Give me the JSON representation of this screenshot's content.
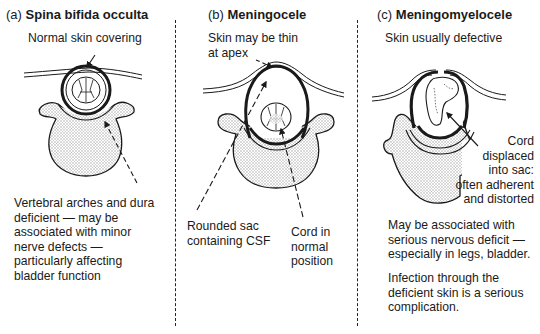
{
  "panels": [
    {
      "id": "a",
      "prefix": "(a)",
      "title": "Spina bifida occulta",
      "labels": {
        "top": "Normal skin covering",
        "bottom": [
          "Vertebral arches and dura",
          "deficient — may be",
          "associated with minor",
          "nerve defects —",
          "particularly affecting",
          "bladder function"
        ]
      }
    },
    {
      "id": "b",
      "prefix": "(b)",
      "title": "Meningocele",
      "labels": {
        "top": [
          "Skin may be thin",
          "at apex"
        ],
        "sac": [
          "Rounded sac",
          "containing CSF"
        ],
        "cord": [
          "Cord in",
          "normal",
          "position"
        ]
      }
    },
    {
      "id": "c",
      "prefix": "(c)",
      "title": "Meningomyelocele",
      "labels": {
        "top": "Skin usually defective",
        "cord": [
          "Cord",
          "displaced",
          "into sac:",
          "often adherent",
          "and distorted"
        ],
        "bottom1": [
          "May be associated with",
          "serious nervous deficit —",
          "especially in legs, bladder."
        ],
        "bottom2": [
          "Infection through the",
          "deficient skin is a serious",
          "complication."
        ]
      }
    }
  ],
  "colors": {
    "ink": "#1a1a1a",
    "bone_fill": "#e6e6e6",
    "background": "#ffffff"
  }
}
